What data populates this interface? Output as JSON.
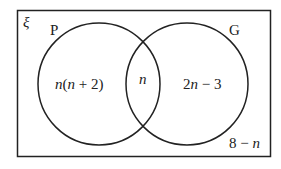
{
  "diagram": {
    "type": "venn",
    "universal_set_symbol": "ξ",
    "sets": [
      {
        "name": "P",
        "label": "P"
      },
      {
        "name": "G",
        "label": "G"
      }
    ],
    "regions": {
      "p_only": {
        "n_part": "n",
        "rest": "(",
        "n_part2": "n",
        "rest2": " + 2)",
        "full": "n(n + 2)"
      },
      "intersection": {
        "full": "n"
      },
      "g_only": {
        "lead": "2",
        "n_part": "n",
        "rest": " − 3",
        "full": "2n − 3"
      },
      "outside": {
        "lead": "8 − ",
        "n_part": "n",
        "full": "8 − n"
      }
    },
    "colors": {
      "stroke": "#222222",
      "background": "#ffffff"
    }
  }
}
